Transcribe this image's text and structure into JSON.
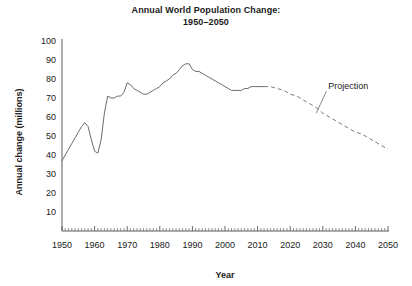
{
  "chart_data": {
    "type": "line",
    "title": "Annual World Population Change:",
    "subtitle": "1950–2050",
    "xlabel": "Year",
    "ylabel": "Annual change (millions)",
    "xlim": [
      1950,
      2050
    ],
    "ylim": [
      0,
      100
    ],
    "ytick_labels": [
      "10",
      "20",
      "30",
      "40",
      "50",
      "60",
      "70",
      "80",
      "90",
      "100"
    ],
    "ytick_values": [
      10,
      20,
      30,
      40,
      50,
      60,
      70,
      80,
      90,
      100
    ],
    "xtick_labels": [
      "1950",
      "1960",
      "1970",
      "1980",
      "1990",
      "2000",
      "2010",
      "2020",
      "2030",
      "2040",
      "2050"
    ],
    "xtick_values": [
      1950,
      1960,
      1970,
      1980,
      1990,
      2000,
      2010,
      2020,
      2030,
      2040,
      2050
    ],
    "grid": false,
    "legend": "none",
    "minor_tick_interval": 1,
    "annotations": [
      {
        "text": "Projection",
        "points_to_year": 2028,
        "points_to_value": 62
      }
    ],
    "series": [
      {
        "name": "Annual world population change (historical)",
        "style": "solid",
        "color": "#6b6b6b",
        "x": [
          1950,
          1951,
          1952,
          1953,
          1954,
          1955,
          1956,
          1957,
          1958,
          1959,
          1960,
          1961,
          1962,
          1963,
          1964,
          1965,
          1966,
          1967,
          1968,
          1969,
          1970,
          1971,
          1972,
          1973,
          1974,
          1975,
          1976,
          1977,
          1978,
          1979,
          1980,
          1981,
          1982,
          1983,
          1984,
          1985,
          1986,
          1987,
          1988,
          1989,
          1990,
          1991,
          1992,
          1993,
          1994,
          1995,
          1996,
          1997,
          1998,
          1999,
          2000,
          2001,
          2002,
          2003,
          2004,
          2005,
          2006,
          2007,
          2008,
          2009,
          2010,
          2011,
          2012
        ],
        "y": [
          37,
          40,
          43,
          46,
          49,
          52,
          55,
          57,
          55,
          48,
          42,
          41,
          48,
          62,
          71,
          70,
          70,
          71,
          71,
          73,
          78,
          77,
          75,
          74,
          73,
          72,
          72,
          73,
          74,
          75,
          76,
          78,
          79,
          80,
          82,
          83,
          85,
          87,
          88,
          88,
          85,
          84,
          84,
          83,
          82,
          81,
          80,
          79,
          78,
          77,
          76,
          75,
          74,
          74,
          74,
          74,
          75,
          75,
          76,
          76,
          76,
          76,
          76
        ]
      },
      {
        "name": "Annual world population change (projection)",
        "style": "dashed",
        "color": "#7a7a7a",
        "x": [
          2012,
          2014,
          2016,
          2018,
          2020,
          2022,
          2024,
          2026,
          2028,
          2030,
          2032,
          2034,
          2036,
          2038,
          2040,
          2042,
          2044,
          2046,
          2048,
          2050
        ],
        "y": [
          76,
          76,
          75,
          74,
          72,
          71,
          69,
          67,
          65,
          62,
          60,
          58,
          56,
          54,
          52,
          51,
          49,
          47,
          45,
          43
        ]
      }
    ]
  }
}
